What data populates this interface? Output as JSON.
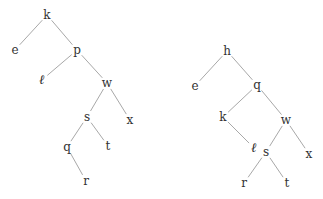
{
  "diagram": {
    "type": "binary-search-tree-pair",
    "colors": {
      "edge": "#a8a8a8",
      "label": "#333333",
      "background": "#ffffff"
    },
    "trees": [
      {
        "name": "left-tree",
        "nodes": [
          {
            "id": "L_k",
            "label": "k",
            "x": 47,
            "y": 15
          },
          {
            "id": "L_e",
            "label": "e",
            "x": 15,
            "y": 50
          },
          {
            "id": "L_p",
            "label": "p",
            "x": 77,
            "y": 50
          },
          {
            "id": "L_l",
            "label": "ℓ",
            "x": 42,
            "y": 80,
            "script": true
          },
          {
            "id": "L_w",
            "label": "w",
            "x": 107,
            "y": 83
          },
          {
            "id": "L_s",
            "label": "s",
            "x": 87,
            "y": 117
          },
          {
            "id": "L_x",
            "label": "x",
            "x": 130,
            "y": 120
          },
          {
            "id": "L_q",
            "label": "q",
            "x": 67,
            "y": 147
          },
          {
            "id": "L_t",
            "label": "t",
            "x": 108,
            "y": 146
          },
          {
            "id": "L_r",
            "label": "r",
            "x": 86,
            "y": 181
          }
        ],
        "edges": [
          [
            "L_k",
            "L_e"
          ],
          [
            "L_k",
            "L_p"
          ],
          [
            "L_p",
            "L_l"
          ],
          [
            "L_p",
            "L_w"
          ],
          [
            "L_w",
            "L_s"
          ],
          [
            "L_w",
            "L_x"
          ],
          [
            "L_s",
            "L_q"
          ],
          [
            "L_s",
            "L_t"
          ],
          [
            "L_q",
            "L_r"
          ]
        ]
      },
      {
        "name": "right-tree",
        "nodes": [
          {
            "id": "R_h",
            "label": "h",
            "x": 227,
            "y": 51
          },
          {
            "id": "R_e",
            "label": "e",
            "x": 195,
            "y": 86
          },
          {
            "id": "R_q",
            "label": "q",
            "x": 257,
            "y": 85
          },
          {
            "id": "R_k",
            "label": "k",
            "x": 223,
            "y": 117
          },
          {
            "id": "R_w",
            "label": "w",
            "x": 286,
            "y": 120
          },
          {
            "id": "R_l",
            "label": "ℓ",
            "x": 254,
            "y": 148,
            "script": true
          },
          {
            "id": "R_s",
            "label": "s",
            "x": 266,
            "y": 152
          },
          {
            "id": "R_x",
            "label": "x",
            "x": 309,
            "y": 154
          },
          {
            "id": "R_r",
            "label": "r",
            "x": 244,
            "y": 183
          },
          {
            "id": "R_t",
            "label": "t",
            "x": 287,
            "y": 183
          }
        ],
        "edges": [
          [
            "R_h",
            "R_e"
          ],
          [
            "R_h",
            "R_q"
          ],
          [
            "R_q",
            "R_k"
          ],
          [
            "R_q",
            "R_w"
          ],
          [
            "R_k",
            "R_l"
          ],
          [
            "R_w",
            "R_s"
          ],
          [
            "R_w",
            "R_x"
          ],
          [
            "R_s",
            "R_r"
          ],
          [
            "R_s",
            "R_t"
          ]
        ]
      }
    ]
  }
}
